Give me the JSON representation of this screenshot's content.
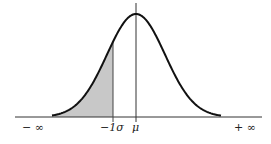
{
  "chart_data": {
    "type": "area",
    "title": "",
    "xlabel": "",
    "ylabel": "",
    "tick_labels": [
      "− ∞",
      "−1σ",
      "μ",
      "+ ∞"
    ],
    "mean_px": 136,
    "sigma_px": 29,
    "shaded_region": {
      "from": "− ∞",
      "to": "−1σ"
    },
    "grid": false,
    "legend": null
  },
  "labels": {
    "neg_inf": "− ∞",
    "neg_sigma": "−1σ",
    "mu": "μ",
    "pos_inf": "+ ∞"
  },
  "colors": {
    "curve": "#111111",
    "shade": "#c8c8c8",
    "axis": "#333333"
  }
}
